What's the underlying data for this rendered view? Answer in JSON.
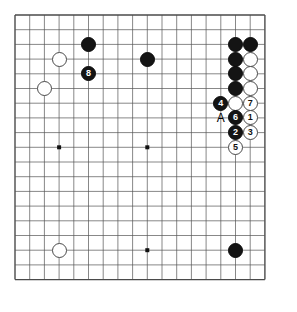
{
  "diagram": {
    "kind": "go-board-diagram",
    "board": {
      "columns": 18,
      "rows": 19,
      "spacing": 14.7,
      "origin_x": 15,
      "origin_y": 15,
      "line_color": "#555555",
      "border_color": "#4a4a4a",
      "background_color": "#ffffff",
      "star_point_color": "#111111",
      "star_points": [
        {
          "col": 3,
          "row": 9
        },
        {
          "col": 9,
          "row": 9
        },
        {
          "col": 9,
          "row": 16
        }
      ]
    },
    "colors": {
      "black_stone": "#141414",
      "white_stone": "#ffffff",
      "white_stone_edge": "#4a4a4a",
      "black_label_text": "#ffffff",
      "white_label_text": "#111111",
      "marker_text": "#000000"
    },
    "stones": [
      {
        "id": "b-upper-left-high",
        "color": "black",
        "col": 5,
        "row": 2,
        "label": ""
      },
      {
        "id": "w-upper-left-a",
        "color": "white",
        "col": 3,
        "row": 3,
        "label": ""
      },
      {
        "id": "b-move-8",
        "color": "black",
        "col": 5,
        "row": 4,
        "label": "8"
      },
      {
        "id": "w-upper-left-b",
        "color": "white",
        "col": 2,
        "row": 5,
        "label": ""
      },
      {
        "id": "b-top-center",
        "color": "black",
        "col": 9,
        "row": 3,
        "label": ""
      },
      {
        "id": "b-right-r2-c15",
        "color": "black",
        "col": 15,
        "row": 2,
        "label": ""
      },
      {
        "id": "b-right-r2-c16",
        "color": "black",
        "col": 16,
        "row": 2,
        "label": ""
      },
      {
        "id": "b-right-r3-c15",
        "color": "black",
        "col": 15,
        "row": 3,
        "label": ""
      },
      {
        "id": "w-right-r3-c16",
        "color": "white",
        "col": 16,
        "row": 3,
        "label": ""
      },
      {
        "id": "b-right-r4-c15",
        "color": "black",
        "col": 15,
        "row": 4,
        "label": ""
      },
      {
        "id": "w-right-r4-c16",
        "color": "white",
        "col": 16,
        "row": 4,
        "label": ""
      },
      {
        "id": "b-right-r5-c15",
        "color": "black",
        "col": 15,
        "row": 5,
        "label": ""
      },
      {
        "id": "w-right-r5-c16",
        "color": "white",
        "col": 16,
        "row": 5,
        "label": ""
      },
      {
        "id": "b-move-4",
        "color": "black",
        "col": 14,
        "row": 6,
        "label": "4"
      },
      {
        "id": "w-right-r6-c15",
        "color": "white",
        "col": 15,
        "row": 6,
        "label": ""
      },
      {
        "id": "w-move-7",
        "color": "white",
        "col": 16,
        "row": 6,
        "label": "7"
      },
      {
        "id": "b-move-6",
        "color": "black",
        "col": 15,
        "row": 7,
        "label": "6"
      },
      {
        "id": "w-move-1",
        "color": "white",
        "col": 16,
        "row": 7,
        "label": "1"
      },
      {
        "id": "b-move-2",
        "color": "black",
        "col": 15,
        "row": 8,
        "label": "2"
      },
      {
        "id": "w-move-3",
        "color": "white",
        "col": 16,
        "row": 8,
        "label": "3"
      },
      {
        "id": "w-move-5",
        "color": "white",
        "col": 15,
        "row": 9,
        "label": "5"
      },
      {
        "id": "w-lower-left",
        "color": "white",
        "col": 3,
        "row": 16,
        "label": ""
      },
      {
        "id": "b-lower-right",
        "color": "black",
        "col": 15,
        "row": 16,
        "label": ""
      }
    ],
    "markers": [
      {
        "id": "marker-a",
        "label": "A",
        "col": 14,
        "row": 7
      }
    ]
  }
}
